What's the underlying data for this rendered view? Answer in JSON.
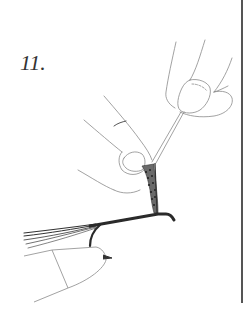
{
  "figure": {
    "step_label": "11.",
    "elements": [
      "right-hand-holding-hackle-pliers",
      "left-hand-fingers-holding-hackle",
      "hackle-feather",
      "hook-shank",
      "tail-fibers",
      "vise-jaws"
    ]
  },
  "colors": {
    "ink": "#333333",
    "light_line": "#8a8a8a",
    "rule": "#555555",
    "background": "#ffffff"
  }
}
